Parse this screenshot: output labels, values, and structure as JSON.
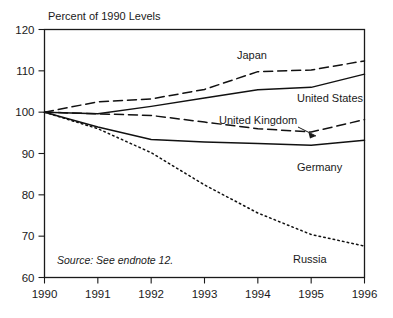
{
  "chart_data": {
    "type": "line",
    "title": "",
    "ylabel": "Percent of 1990 Levels",
    "xlabel": "",
    "x": [
      1990,
      1991,
      1992,
      1993,
      1994,
      1995,
      1996
    ],
    "xlim": [
      1990,
      1996
    ],
    "ylim": [
      60,
      120
    ],
    "yticks": [
      60,
      70,
      80,
      90,
      100,
      110,
      120
    ],
    "xticks": [
      "1990",
      "1991",
      "1992",
      "1993",
      "1994",
      "1995",
      "1996"
    ],
    "grid": false,
    "legend_position": "inline-labels",
    "source_note": "Source: See endnote 12.",
    "series": [
      {
        "name": "Japan",
        "style": "dashed",
        "label": "Japan",
        "values": [
          100,
          102.5,
          103.2,
          105.5,
          109.8,
          110.2,
          112.4
        ]
      },
      {
        "name": "United States",
        "style": "solid",
        "label": "United States",
        "values": [
          100,
          99.6,
          101.4,
          103.4,
          105.4,
          106.0,
          109.2
        ]
      },
      {
        "name": "United Kingdom",
        "style": "dashed",
        "label": "United Kingdom",
        "values": [
          100,
          99.6,
          99.2,
          97.6,
          96.0,
          95.2,
          98.2
        ]
      },
      {
        "name": "Germany",
        "style": "solid",
        "label": "Germany",
        "values": [
          100,
          96.4,
          93.4,
          92.8,
          92.4,
          92.0,
          93.2
        ]
      },
      {
        "name": "Russia",
        "style": "dotted",
        "label": "Russia",
        "values": [
          100,
          96.0,
          90.2,
          82.4,
          75.6,
          70.4,
          67.6
        ]
      }
    ]
  },
  "annotations": {
    "uk_pointer": "pointer-arrow-to-united-kingdom-line"
  }
}
